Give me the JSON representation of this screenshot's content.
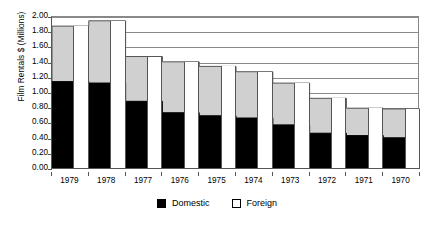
{
  "chart_data": {
    "type": "area",
    "title": "",
    "xlabel": "",
    "ylabel": "Film Rentals $ (Millions)",
    "categories": [
      "1979",
      "1978",
      "1977",
      "1976",
      "1975",
      "1974",
      "1973",
      "1972",
      "1971",
      "1970"
    ],
    "ylim": [
      0.0,
      2.0
    ],
    "ytick_step": 0.2,
    "ytick_labels": [
      "2.00",
      "1.80",
      "1.60",
      "1.40",
      "1.20",
      "1.00",
      "0.80",
      "0.60",
      "0.40",
      "0.20",
      "0.00"
    ],
    "ytick_values": [
      2.0,
      1.8,
      1.6,
      1.4,
      1.2,
      1.0,
      0.8,
      0.6,
      0.4,
      0.2,
      0.0
    ],
    "grid": true,
    "legend_position": "bottom",
    "stacked": true,
    "series": [
      {
        "name": "Domestic",
        "color": "#000000",
        "values": [
          1.15,
          1.13,
          0.89,
          0.74,
          0.7,
          0.67,
          0.58,
          0.47,
          0.44,
          0.41
        ]
      },
      {
        "name": "Foreign",
        "color": "#d0d0d0",
        "values": [
          0.73,
          0.82,
          0.59,
          0.67,
          0.65,
          0.61,
          0.55,
          0.46,
          0.36,
          0.38
        ]
      }
    ],
    "totals": [
      1.88,
      1.95,
      1.48,
      1.41,
      1.35,
      1.28,
      1.13,
      0.93,
      0.8,
      0.79
    ]
  },
  "legend": {
    "items": [
      {
        "label": "Domestic",
        "swatch": "black-square-icon"
      },
      {
        "label": "Foreign",
        "swatch": "white-square-icon"
      }
    ]
  }
}
